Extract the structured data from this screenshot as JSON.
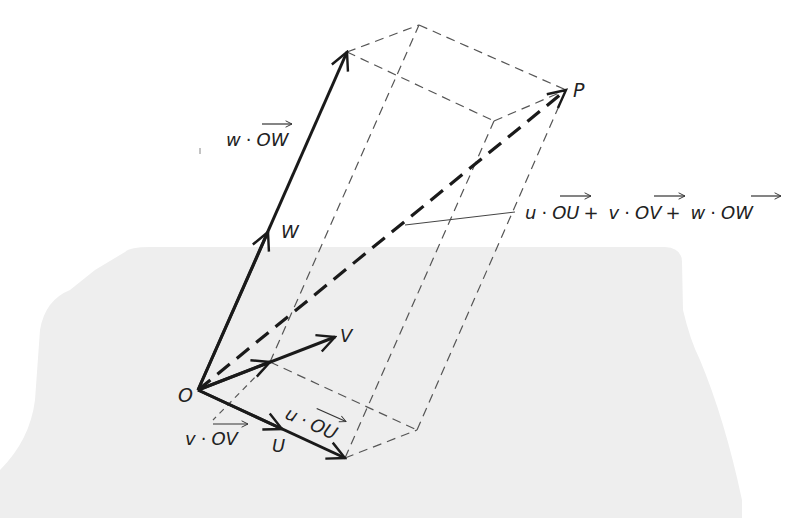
{
  "colors": {
    "plane_fill": "#eeeeee",
    "line": "#1a1a1a",
    "dashed_edge": "#555555",
    "background": "#ffffff"
  },
  "points": {
    "O": [
      198,
      390
    ],
    "U": [
      345,
      458
    ],
    "V_base": [
      270,
      362
    ],
    "UV_base": [
      417,
      430
    ],
    "W": [
      347,
      52
    ],
    "VW": [
      419,
      25
    ],
    "UW": [
      494,
      121
    ],
    "P": [
      566,
      90
    ],
    "V_tip": [
      335,
      337
    ]
  },
  "labels": {
    "origin": "O",
    "point": "P",
    "u_vec": "U",
    "v_vec": "V",
    "w_vec": "W",
    "u_scaled_coef": "u",
    "u_scaled_vec": "OU",
    "v_scaled_coef": "v",
    "v_scaled_vec": "OV",
    "w_scaled_coef": "w",
    "w_scaled_vec": "OW",
    "dot": "·",
    "sum_part1_coef": "u",
    "sum_part1_vec": "OU",
    "plus": "+",
    "sum_part2_coef": "v",
    "sum_part2_vec": "OV",
    "sum_part3_coef": "w",
    "sum_part3_vec": "OW"
  }
}
